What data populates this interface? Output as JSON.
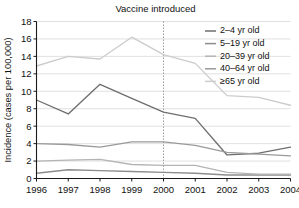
{
  "chart_data": {
    "type": "line",
    "title": "Vaccine introduced",
    "xlabel": "",
    "ylabel": "Incidence (cases per 100,000)",
    "categories": [
      "1996",
      "1997",
      "1998",
      "1999",
      "2000",
      "2001",
      "2002",
      "2003",
      "2004"
    ],
    "x": [
      1996,
      1997,
      1998,
      1999,
      2000,
      2001,
      2002,
      2003,
      2004
    ],
    "xlim": [
      1996,
      2004
    ],
    "ylim": [
      0,
      18
    ],
    "yticks": [
      0,
      2,
      4,
      6,
      8,
      10,
      12,
      14,
      16,
      18
    ],
    "grid": true,
    "legend_position": "top-right",
    "annotations": [
      {
        "label": "Vaccine introduced",
        "type": "vertical-line",
        "x": 2000
      }
    ],
    "series": [
      {
        "name": "2–4 yr old",
        "color": "#6e6e6e",
        "values": [
          9.0,
          7.4,
          10.8,
          9.2,
          7.6,
          6.9,
          2.7,
          2.9,
          3.6
        ]
      },
      {
        "name": "5–19 yr old",
        "color": "#8c8c8c",
        "values": [
          0.6,
          1.0,
          0.9,
          0.8,
          0.7,
          0.6,
          0.4,
          0.4,
          0.4
        ]
      },
      {
        "name": "20–39 yr old",
        "color": "#b4b4b4",
        "values": [
          2.0,
          2.1,
          2.2,
          1.6,
          1.5,
          1.5,
          0.7,
          0.5,
          0.5
        ]
      },
      {
        "name": "40–64 yr old",
        "color": "#9a9a9a",
        "values": [
          4.0,
          3.9,
          3.6,
          4.2,
          4.2,
          3.8,
          3.0,
          2.8,
          2.6
        ]
      },
      {
        "name": "≥65 yr old",
        "color": "#cccccc",
        "values": [
          12.9,
          14.0,
          13.7,
          16.2,
          14.2,
          13.2,
          9.5,
          9.3,
          8.4
        ]
      }
    ]
  },
  "legend": {
    "entries": [
      "2–4 yr old",
      "5–19 yr old",
      "20–39 yr old",
      "40–64 yr old",
      "≥65 yr old"
    ]
  }
}
